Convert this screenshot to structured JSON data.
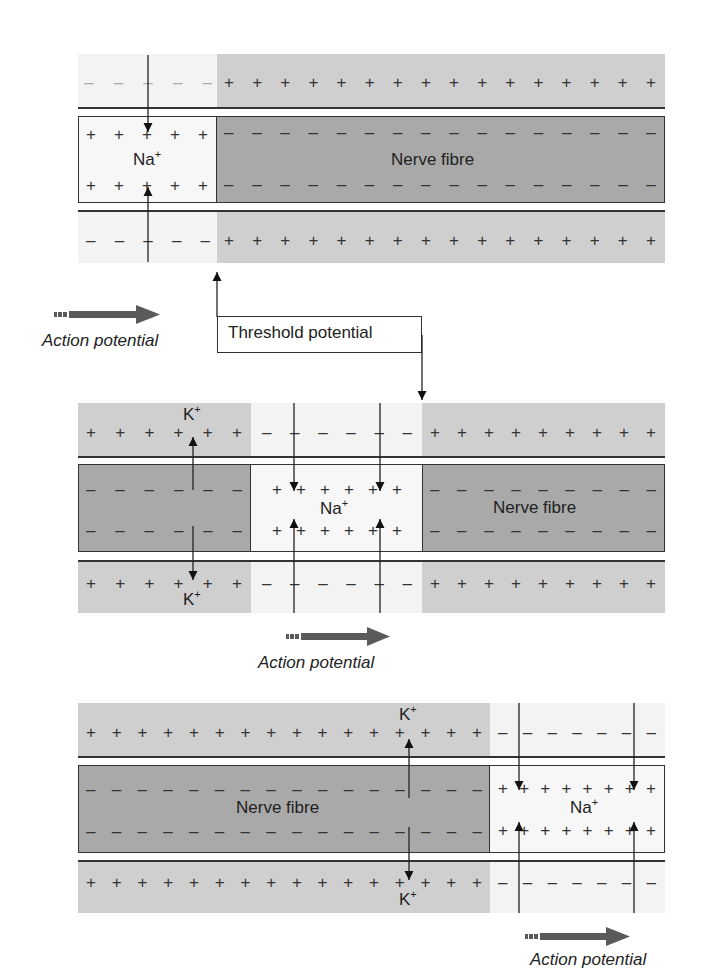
{
  "labels": {
    "nerve_fibre": "Nerve fibre",
    "na": "Na",
    "k": "K",
    "ion_charge": "+",
    "action_potential": "Action potential",
    "threshold_potential": "Threshold potential"
  },
  "charges": {
    "p1_top_left": "– – – – –",
    "p1_top_right": "+ + + + + + + + + + + + + + + +",
    "p1_fib_left": "+ + + + +",
    "p1_fib_right": "– – – – – – – – – – – – – – – –",
    "p1_bot_left": "– – + – –",
    "p1_bot_right": "+ + + + + + + + + + + + + + + +",
    "p2_top_left": "+ + + + + +",
    "p2_top_mid": "– + – – + –",
    "p2_top_right": "+ + + + + + + + +",
    "p2_fib_left": "– – – – – –",
    "p2_fib_mid": "+ + + + + +",
    "p2_fib_right": "– – – – – – – – –",
    "p3_top_left": "+ + + + + + + + + + + + + + + +",
    "p3_top_right": "– – – – – – –",
    "p3_fib_left": "– – – – – – – – – – – – – – – –",
    "p3_fib_right": "+ + + + + + + +"
  },
  "colors": {
    "extracellular_polarized": "#cfcfcf",
    "extracellular_depolarized": "#f3f3f3",
    "fibre_polarized": "#a9a9a9",
    "fibre_depolarized": "#f7f7f7",
    "arrow": "#555555"
  }
}
